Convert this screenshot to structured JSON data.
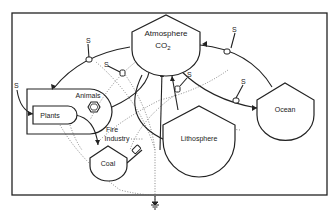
{
  "diagram": {
    "type": "energy-systems carbon cycle diagram",
    "nodes": {
      "atmosphere": {
        "label": "Atmosphere",
        "sublabel": "CO",
        "subscript": "2"
      },
      "ocean": {
        "label": "Ocean"
      },
      "lithosphere": {
        "label": "Lithosphere"
      },
      "plants": {
        "label": "Plants"
      },
      "animals": {
        "label": "Animals"
      },
      "coal": {
        "label": "Coal"
      },
      "fire_industry": {
        "line1": "Fire",
        "line2": "Industry"
      }
    },
    "sources": {
      "s1": "S",
      "s2": "S",
      "s3": "S",
      "s4": "S",
      "s5": "S",
      "s6": "S"
    },
    "symbols": {
      "valve": "workgate-icon",
      "consumer": "hexagon-consumer-icon",
      "heat_sink": "heat-sink-ground-icon"
    },
    "colors": {
      "line": "#222222",
      "dotted": "#666666",
      "background": "#ffffff"
    }
  }
}
